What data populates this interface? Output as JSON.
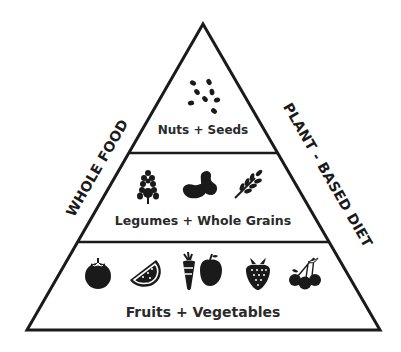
{
  "diagram": {
    "type": "food-pyramid",
    "colors": {
      "line": "#1a1a1a",
      "text": "#2a2a2a",
      "icon": "#1a1a1a",
      "background": "#ffffff"
    },
    "side_labels": {
      "left": "WHOLE FOOD",
      "right": "PLANT - BASED DIET"
    },
    "tiers": [
      {
        "label": "Nuts + Seeds",
        "icons": [
          "seeds-icon"
        ]
      },
      {
        "label": "Legumes + Whole Grains",
        "icons": [
          "corn-icon",
          "beans-icon",
          "wheat-icon"
        ]
      },
      {
        "label": "Fruits + Vegetables",
        "icons": [
          "tomato-icon",
          "watermelon-icon",
          "carrot-apple-icon",
          "strawberry-icon",
          "cherries-icon"
        ]
      }
    ]
  }
}
